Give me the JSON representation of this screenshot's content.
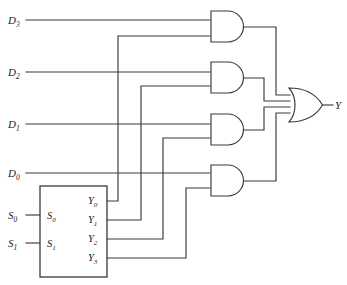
{
  "diagram": {
    "type": "logic-circuit-schematic",
    "colors": {
      "background": "#ffffff",
      "wire": "#3a3a3a",
      "text": "#1c1c1c"
    },
    "data_inputs": [
      {
        "id": "D3",
        "base": "D",
        "sub": "3",
        "label": "D3",
        "y": 20
      },
      {
        "id": "D2",
        "base": "D",
        "sub": "2",
        "label": "D2",
        "y": 72
      },
      {
        "id": "D1",
        "base": "D",
        "sub": "1",
        "label": "D1",
        "y": 124
      },
      {
        "id": "D0",
        "base": "D",
        "sub": "0",
        "label": "D0",
        "y": 173
      }
    ],
    "select_inputs": [
      {
        "id": "S0",
        "base": "S",
        "sub": "0",
        "label": "S0",
        "y": 215
      },
      {
        "id": "S1",
        "base": "S",
        "sub": "1",
        "label": "S1",
        "y": 243
      }
    ],
    "decoder": {
      "name": "decoder-block",
      "input_pin_labels": [
        {
          "base": "S",
          "sub": "0",
          "label": "S0"
        },
        {
          "base": "S",
          "sub": "1",
          "label": "S1"
        }
      ],
      "output_pin_labels": [
        {
          "base": "Y",
          "sub": "0",
          "label": "Y0",
          "y": 201
        },
        {
          "base": "Y",
          "sub": "1",
          "label": "Y1",
          "y": 220
        },
        {
          "base": "Y",
          "sub": "2",
          "label": "Y2",
          "y": 239
        },
        {
          "base": "Y",
          "sub": "3",
          "label": "Y3",
          "y": 258
        }
      ]
    },
    "and_gates": [
      {
        "name": "and-gate-1",
        "inputs": [
          "D3",
          "Y0"
        ]
      },
      {
        "name": "and-gate-2",
        "inputs": [
          "D2",
          "Y1"
        ]
      },
      {
        "name": "and-gate-3",
        "inputs": [
          "D1",
          "Y2"
        ]
      },
      {
        "name": "and-gate-4",
        "inputs": [
          "D0",
          "Y3"
        ]
      }
    ],
    "or_gate": {
      "name": "or-gate",
      "inputs": [
        "and-gate-1",
        "and-gate-2",
        "and-gate-3",
        "and-gate-4"
      ]
    },
    "output": {
      "id": "Y",
      "base": "Y",
      "sub": "",
      "label": "Y"
    }
  }
}
